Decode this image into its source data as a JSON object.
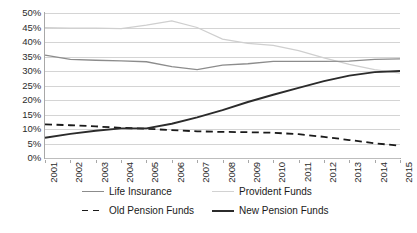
{
  "chart_data": {
    "type": "line",
    "title": "",
    "subtitle": "",
    "xlabel": "",
    "ylabel": "",
    "x": [
      "2001",
      "2002",
      "2003",
      "2004",
      "2005",
      "2006",
      "2007",
      "2008",
      "2009",
      "2010",
      "2011",
      "2012",
      "2013",
      "2014",
      "2015"
    ],
    "categories": [
      "2001",
      "2002",
      "2003",
      "2004",
      "2005",
      "2006",
      "2007",
      "2008",
      "2009",
      "2010",
      "2011",
      "2012",
      "2013",
      "2014",
      "2015"
    ],
    "ylim": [
      0,
      50
    ],
    "ytick_step": 5,
    "ytick_labels": [
      "50%",
      "45%",
      "40%",
      "35%",
      "30%",
      "25%",
      "20%",
      "15%",
      "10%",
      "5%",
      "0%"
    ],
    "ytick_values": [
      50,
      45,
      40,
      35,
      30,
      25,
      20,
      15,
      10,
      5,
      0
    ],
    "grid": true,
    "grid_axis": "y",
    "legend_position": "bottom",
    "value_suffix": "%",
    "series": [
      {
        "name": "Life Insurance",
        "color": "#8c8c8c",
        "style": "solid",
        "values": [
          35.5,
          34.0,
          33.7,
          33.5,
          33.2,
          31.5,
          30.5,
          32.0,
          32.5,
          33.3,
          33.3,
          33.3,
          33.4,
          34.0,
          34.2
        ]
      },
      {
        "name": "Provident Funds",
        "color": "#cfcfcf",
        "style": "solid",
        "values": [
          45.0,
          44.8,
          44.8,
          44.6,
          45.8,
          47.3,
          45.0,
          41.0,
          39.5,
          38.8,
          37.0,
          34.5,
          32.3,
          30.5,
          29.3
        ]
      },
      {
        "name": "Old Pension Funds",
        "color": "#1a1a1a",
        "style": "dashed",
        "values": [
          11.6,
          11.3,
          10.9,
          10.4,
          10.1,
          9.6,
          9.2,
          9.0,
          8.9,
          8.7,
          8.2,
          7.3,
          6.2,
          5.1,
          4.2
        ]
      },
      {
        "name": "New Pension Funds",
        "color": "#2b2b2b",
        "style": "solid",
        "values": [
          7.0,
          8.3,
          9.4,
          10.2,
          10.2,
          11.8,
          14.0,
          16.5,
          19.3,
          21.8,
          24.2,
          26.5,
          28.4,
          29.6,
          30.0
        ]
      }
    ]
  },
  "legend": {
    "items": [
      {
        "label": "Life Insurance",
        "swatch": "line-solid-gray-icon"
      },
      {
        "label": "Provident Funds",
        "swatch": "line-solid-lightgray-icon"
      },
      {
        "label": "Old Pension Funds",
        "swatch": "line-dashed-black-icon"
      },
      {
        "label": "New Pension Funds",
        "swatch": "line-solid-black-icon"
      }
    ]
  }
}
